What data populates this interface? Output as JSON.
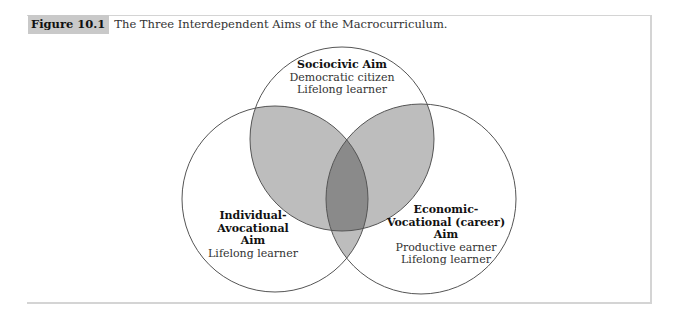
{
  "figure": {
    "label": "Figure 10.1",
    "title": "The Three Interdependent Aims of the Macrocurriculum."
  },
  "venn": {
    "circles": [
      {
        "id": "sociocivic",
        "title_lines": [
          "Sociocivic Aim"
        ],
        "items": [
          "Democratic citizen",
          "Lifelong learner"
        ]
      },
      {
        "id": "individual-avocational",
        "title_lines": [
          "Individual-",
          "Avocational",
          "Aim"
        ],
        "items": [
          "Lifelong learner"
        ]
      },
      {
        "id": "economic-vocational",
        "title_lines": [
          "Economic-",
          "Vocational (career)",
          "Aim"
        ],
        "items": [
          "Productive earner",
          "Lifelong learner"
        ]
      }
    ],
    "colors": {
      "outline": "#555555",
      "pair_overlap": "#bdbdbd",
      "triple_overlap": "#8a8a8a",
      "caption_label_bg": "#c9c9c9"
    }
  }
}
